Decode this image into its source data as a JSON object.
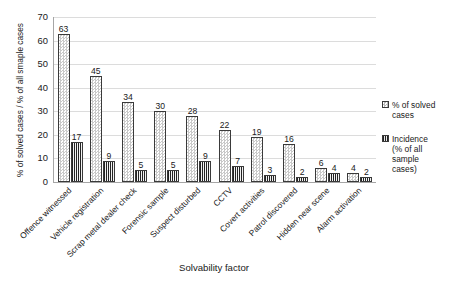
{
  "chart_data": {
    "type": "bar",
    "title": "",
    "xlabel": "Solvability factor",
    "ylabel": "% of solved cases / % of all smaple cases",
    "ylim": [
      0,
      70
    ],
    "yticks": [
      0,
      10,
      20,
      30,
      40,
      50,
      60,
      70
    ],
    "grid": true,
    "legend_position": "right",
    "categories": [
      "Offence witnessed",
      "Vehicle registration",
      "Scrap metal dealer check",
      "Forensic sample",
      "Suspect disturbed",
      "CCTV",
      "Covert activities",
      "Patrol discovered",
      "Hidden near scene",
      "Alarm activation"
    ],
    "series": [
      {
        "name": "% of solved cases",
        "values": [
          63,
          45,
          34,
          30,
          28,
          22,
          19,
          16,
          6,
          4
        ]
      },
      {
        "name": "Incidence (% of all sample cases)",
        "values": [
          17,
          9,
          5,
          5,
          9,
          7,
          3,
          2,
          4,
          2
        ]
      }
    ]
  },
  "legend": {
    "entries": [
      {
        "label": "% of solved\ncases",
        "swatch": "checker-light-swatch"
      },
      {
        "label": "Incidence\n(% of all\nsample\ncases)",
        "swatch": "hatch-dark-swatch"
      }
    ]
  },
  "colors": {
    "axis": "#a6a6a6",
    "gridline": "#dcdcdc",
    "bar_solved_fill": "#ffffff",
    "bar_solved_pattern": "#c9c9c9",
    "bar_incidence_fill": "#232323",
    "bar_outline": "#3a3a3a",
    "text": "#202020",
    "background": "#ffffff"
  }
}
